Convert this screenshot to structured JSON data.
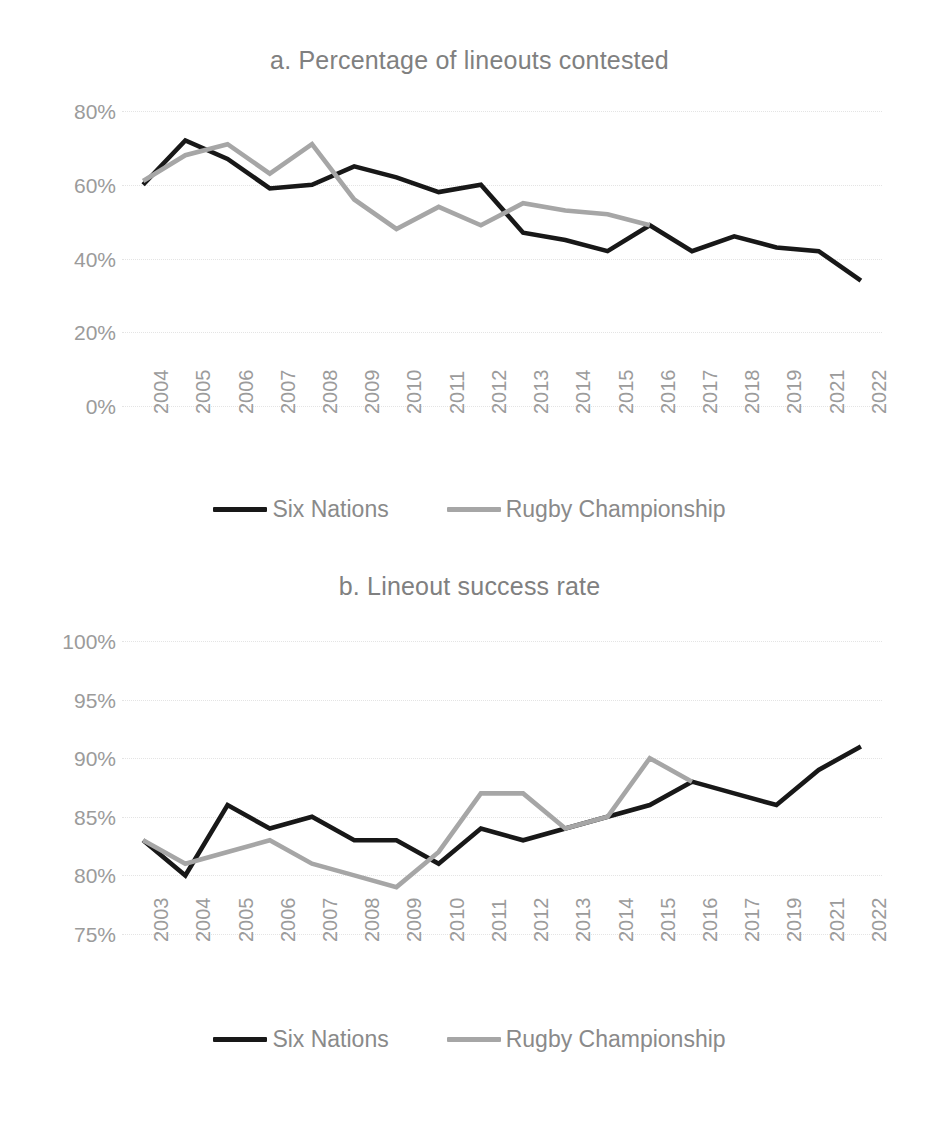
{
  "figure": {
    "background": "#ffffff",
    "text_color": "#7f7f7f"
  },
  "charts": [
    {
      "id": "chart-a",
      "title": "a. Percentage of lineouts contested",
      "legend": [
        {
          "label": "Six Nations",
          "color": "#181818"
        },
        {
          "label": "Rugby Championship",
          "color": "#a6a6a6"
        }
      ]
    },
    {
      "id": "chart-b",
      "title": "b. Lineout success rate",
      "legend": [
        {
          "label": "Six Nations",
          "color": "#181818"
        },
        {
          "label": "Rugby Championship",
          "color": "#a6a6a6"
        }
      ]
    }
  ],
  "chart_data": [
    {
      "type": "line",
      "panel": "a",
      "title": "a. Percentage of lineouts contested",
      "xlabel": "",
      "ylabel": "",
      "ylim": [
        0,
        80
      ],
      "yticks": [
        80,
        60,
        40,
        20,
        0
      ],
      "ytick_labels": [
        "80%",
        "60%",
        "40%",
        "20%",
        "0%"
      ],
      "grid": true,
      "legend_position": "bottom",
      "categories": [
        "2004",
        "2005",
        "2006",
        "2007",
        "2008",
        "2009",
        "2010",
        "2011",
        "2012",
        "2013",
        "2014",
        "2015",
        "2016",
        "2017",
        "2018",
        "2019",
        "2021",
        "2022"
      ],
      "series": [
        {
          "name": "Six Nations",
          "color": "#181818",
          "values": [
            60,
            72,
            67,
            59,
            60,
            65,
            62,
            58,
            60,
            47,
            45,
            42,
            49,
            42,
            46,
            43,
            42,
            34
          ]
        },
        {
          "name": "Rugby Championship",
          "color": "#a6a6a6",
          "values": [
            61,
            68,
            71,
            63,
            71,
            56,
            48,
            54,
            49,
            55,
            53,
            52,
            49,
            null,
            null,
            null,
            null,
            null
          ]
        }
      ]
    },
    {
      "type": "line",
      "panel": "b",
      "title": "b. Lineout success rate",
      "xlabel": "",
      "ylabel": "",
      "ylim": [
        75,
        100
      ],
      "yticks": [
        100,
        95,
        90,
        85,
        80,
        75
      ],
      "ytick_labels": [
        "100%",
        "95%",
        "90%",
        "85%",
        "80%",
        "75%"
      ],
      "grid": true,
      "legend_position": "bottom",
      "categories": [
        "2003",
        "2004",
        "2005",
        "2006",
        "2007",
        "2008",
        "2009",
        "2010",
        "2011",
        "2012",
        "2013",
        "2014",
        "2015",
        "2016",
        "2017",
        "2019",
        "2021",
        "2022"
      ],
      "series": [
        {
          "name": "Six Nations",
          "color": "#181818",
          "values": [
            83,
            80,
            86,
            84,
            85,
            83,
            83,
            81,
            84,
            83,
            84,
            85,
            86,
            88,
            87,
            86,
            89,
            91
          ]
        },
        {
          "name": "Rugby Championship",
          "color": "#a6a6a6",
          "values": [
            83,
            81,
            82,
            83,
            81,
            80,
            79,
            82,
            87,
            87,
            84,
            85,
            90,
            88,
            null,
            null,
            null,
            null
          ]
        }
      ]
    }
  ]
}
